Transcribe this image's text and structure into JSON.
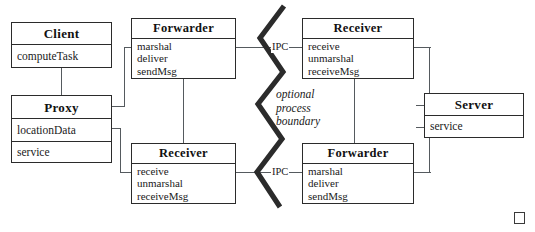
{
  "diagram": {
    "boundary_note": [
      "optional",
      "process",
      "boundary"
    ],
    "ipc_labels": [
      {
        "id": "ipc-top",
        "text": "IPC"
      },
      {
        "id": "ipc-bottom",
        "text": "IPC"
      }
    ],
    "end_marker": "square-marker",
    "colors": {
      "box_border": "#2b2b2b",
      "connector": "#555a5e",
      "boundary_line": "#2b2b2b",
      "text": "#111111",
      "background": "#ffffff"
    },
    "boxes": [
      {
        "id": "client",
        "title": "Client",
        "attributes": [
          [
            "computeTask"
          ]
        ]
      },
      {
        "id": "proxy",
        "title": "Proxy",
        "attributes": [
          [
            "locationData"
          ],
          [
            "service"
          ]
        ]
      },
      {
        "id": "forwarder-left",
        "title": "Forwarder",
        "attributes": [
          [
            "marshal",
            "deliver",
            "sendMsg"
          ]
        ]
      },
      {
        "id": "receiver-left",
        "title": "Receiver",
        "attributes": [
          [
            "receive",
            "unmarshal",
            "receiveMsg"
          ]
        ]
      },
      {
        "id": "receiver-right",
        "title": "Receiver",
        "attributes": [
          [
            "receive",
            "unmarshal",
            "receiveMsg"
          ]
        ]
      },
      {
        "id": "forwarder-right",
        "title": "Forwarder",
        "attributes": [
          [
            "marshal",
            "deliver",
            "sendMsg"
          ]
        ]
      },
      {
        "id": "server",
        "title": "Server",
        "attributes": [
          [
            "service"
          ]
        ]
      }
    ]
  }
}
